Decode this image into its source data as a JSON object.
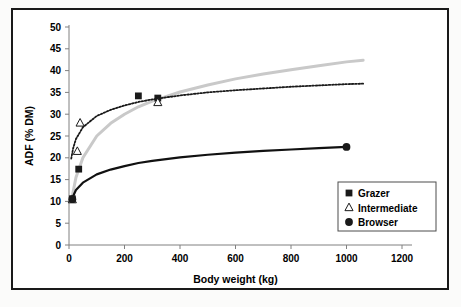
{
  "chart_data": {
    "type": "scatter",
    "title": "",
    "xlabel": "Body weight (kg)",
    "ylabel": "ADF (% DM)",
    "xlim": [
      0,
      1200
    ],
    "ylim": [
      0,
      50
    ],
    "xticks": [
      0,
      200,
      400,
      600,
      800,
      1000,
      1200
    ],
    "yticks": [
      0,
      5,
      10,
      15,
      20,
      25,
      30,
      35,
      40,
      45,
      50
    ],
    "xtick_labels": [
      "0",
      "200",
      "400",
      "600",
      "800",
      "1000",
      "1200"
    ],
    "ytick_labels": [
      "0",
      "5",
      "10",
      "15",
      "20",
      "25",
      "30",
      "35",
      "40",
      "45",
      "50"
    ],
    "grid": false,
    "legend_position": "center right",
    "series": [
      {
        "name": "Grazer",
        "marker": "filled-square",
        "color": "#1a1a1a",
        "points": [
          {
            "x": 12,
            "y": 10.6
          },
          {
            "x": 35,
            "y": 17.4
          },
          {
            "x": 250,
            "y": 34.2
          },
          {
            "x": 320,
            "y": 33.7
          }
        ],
        "trendline": {
          "style": "solid",
          "color": "#c9c9c9",
          "width": 3,
          "x_range": [
            10,
            1060
          ],
          "points_xy": [
            [
              10,
              10.6
            ],
            [
              25,
              15.5
            ],
            [
              50,
              20.0
            ],
            [
              100,
              25.0
            ],
            [
              150,
              27.9
            ],
            [
              200,
              30.0
            ],
            [
              250,
              31.7
            ],
            [
              300,
              33.0
            ],
            [
              400,
              35.1
            ],
            [
              500,
              36.7
            ],
            [
              600,
              38.1
            ],
            [
              700,
              39.2
            ],
            [
              800,
              40.2
            ],
            [
              900,
              41.1
            ],
            [
              1000,
              42.0
            ],
            [
              1060,
              42.4
            ]
          ]
        }
      },
      {
        "name": "Intermediate",
        "marker": "open-triangle",
        "color": "#1a1a1a",
        "points": [
          {
            "x": 12,
            "y": 10.4
          },
          {
            "x": 40,
            "y": 28.0
          },
          {
            "x": 30,
            "y": 21.5
          },
          {
            "x": 320,
            "y": 32.7
          }
        ],
        "trendline": {
          "style": "dotted",
          "color": "#1a1a1a",
          "width": 1.8,
          "x_range": [
            8,
            1060
          ],
          "points_xy": [
            [
              8,
              19.8
            ],
            [
              15,
              22.2
            ],
            [
              25,
              24.3
            ],
            [
              50,
              27.0
            ],
            [
              100,
              29.6
            ],
            [
              150,
              31.0
            ],
            [
              200,
              32.0
            ],
            [
              250,
              32.8
            ],
            [
              300,
              33.4
            ],
            [
              400,
              34.3
            ],
            [
              500,
              35.0
            ],
            [
              600,
              35.5
            ],
            [
              700,
              35.9
            ],
            [
              800,
              36.3
            ],
            [
              900,
              36.6
            ],
            [
              1000,
              36.9
            ],
            [
              1060,
              37.0
            ]
          ]
        }
      },
      {
        "name": "Browser",
        "marker": "filled-circle",
        "color": "#1a1a1a",
        "points": [
          {
            "x": 12,
            "y": 10.5
          },
          {
            "x": 1000,
            "y": 22.5
          }
        ],
        "trendline": {
          "style": "solid",
          "color": "#111111",
          "width": 2.2,
          "x_range": [
            10,
            1000
          ],
          "points_xy": [
            [
              10,
              10.5
            ],
            [
              25,
              12.6
            ],
            [
              50,
              14.3
            ],
            [
              100,
              16.2
            ],
            [
              150,
              17.3
            ],
            [
              200,
              18.1
            ],
            [
              250,
              18.8
            ],
            [
              300,
              19.3
            ],
            [
              400,
              20.1
            ],
            [
              500,
              20.7
            ],
            [
              600,
              21.2
            ],
            [
              700,
              21.6
            ],
            [
              800,
              21.9
            ],
            [
              900,
              22.2
            ],
            [
              1000,
              22.5
            ]
          ]
        }
      }
    ]
  },
  "legend": {
    "items": [
      {
        "label": "Grazer",
        "marker": "filled-square"
      },
      {
        "label": "Intermediate",
        "marker": "open-triangle"
      },
      {
        "label": "Browser",
        "marker": "filled-circle"
      }
    ]
  },
  "colors": {
    "axis": "#808080",
    "text": "#000000",
    "grazer_line": "#c9c9c9",
    "intermediate_line": "#1a1a1a",
    "browser_line": "#111111",
    "frame": "#1a1a1a"
  }
}
